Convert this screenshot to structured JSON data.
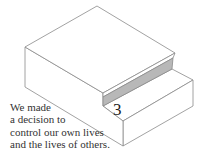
{
  "diagram": {
    "step_number": "3",
    "caption_lines": [
      "We made",
      "a decision to",
      "control our own lives",
      "and the lives of others."
    ],
    "colors": {
      "line": "#8a8a8a",
      "riser_fill": "#b8b8b8",
      "background": "#ffffff"
    }
  }
}
